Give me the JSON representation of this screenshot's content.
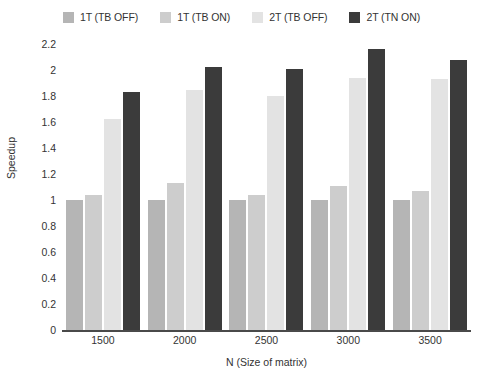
{
  "chart_data": {
    "type": "bar",
    "title": "",
    "xlabel": "N (Size of matrix)",
    "ylabel": "Speedup",
    "categories": [
      "1500",
      "2000",
      "2500",
      "3000",
      "3500"
    ],
    "ylim": [
      0,
      2.2
    ],
    "ytick_step": 0.2,
    "yticks": [
      "2.2",
      "2",
      "1.8",
      "1.6",
      "1.4",
      "1.2",
      "1",
      "0.8",
      "0.6",
      "0.4",
      "0.2",
      "0"
    ],
    "grid": false,
    "legend_position": "top-center",
    "series": [
      {
        "name": "1T (TB OFF)",
        "color": "#b5b5b5",
        "values": [
          1.0,
          1.0,
          1.0,
          1.0,
          1.0
        ]
      },
      {
        "name": "1T (TB ON)",
        "color": "#cdcdcd",
        "values": [
          1.04,
          1.13,
          1.04,
          1.11,
          1.07
        ]
      },
      {
        "name": "2T (TB OFF)",
        "color": "#e3e3e3",
        "values": [
          1.62,
          1.85,
          1.8,
          1.94,
          1.93
        ]
      },
      {
        "name": "2T (TN ON)",
        "color": "#3b3b3b",
        "values": [
          1.83,
          2.02,
          2.01,
          2.16,
          2.08
        ]
      }
    ]
  },
  "colors": {
    "axis": "#4a4a4a",
    "text": "#333333",
    "background": "#ffffff"
  }
}
